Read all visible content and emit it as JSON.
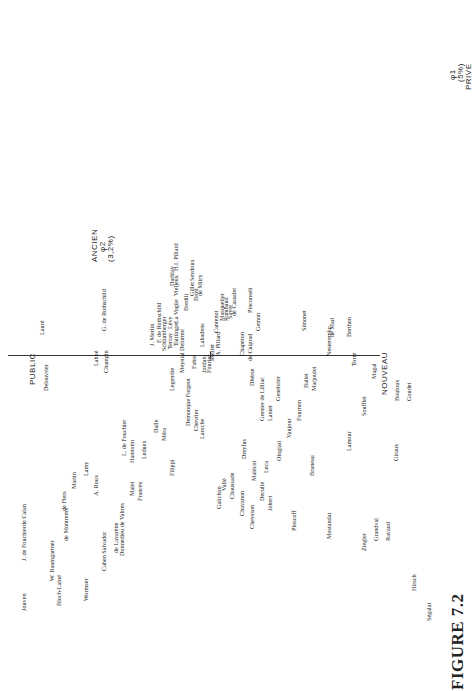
{
  "figure": {
    "caption": "FIGURE 7.2"
  },
  "axes": {
    "top": {
      "label": "ANCIEN",
      "phi": "φ2",
      "pct": "(3,2%)"
    },
    "right": {
      "label": "NOUVEAU"
    },
    "left": {
      "label": "PUBLIC"
    },
    "far_right": {
      "phi": "φ1",
      "pct": "(5%)",
      "label": "PRIVE"
    }
  },
  "names": [
    {
      "t": "Jouven",
      "x": 20,
      "y": 80
    },
    {
      "t": "J. de Fouchier",
      "x": 20,
      "y": 130
    },
    {
      "t": "de Calan",
      "x": 20,
      "y": 165
    },
    {
      "t": "W. Baumgartner",
      "x": 48,
      "y": 110
    },
    {
      "t": "de Flers",
      "x": 60,
      "y": 180
    },
    {
      "t": "Martin",
      "x": 70,
      "y": 202
    },
    {
      "t": "Lamy",
      "x": 82,
      "y": 215
    },
    {
      "t": "A. Roux",
      "x": 92,
      "y": 195
    },
    {
      "t": "de Lavarène",
      "x": 112,
      "y": 138
    },
    {
      "t": "Donnedieu de Vabres",
      "x": 118,
      "y": 135
    },
    {
      "t": "Malet",
      "x": 128,
      "y": 195
    },
    {
      "t": "Francès",
      "x": 136,
      "y": 190
    },
    {
      "t": "L. de Fouchier",
      "x": 120,
      "y": 235
    },
    {
      "t": "Hannotin",
      "x": 128,
      "y": 228
    },
    {
      "t": "Dalle",
      "x": 152,
      "y": 258
    },
    {
      "t": "Méra",
      "x": 160,
      "y": 250
    },
    {
      "t": "Legendre",
      "x": 168,
      "y": 300
    },
    {
      "t": "Meynial",
      "x": 178,
      "y": 318
    },
    {
      "t": "Labadens",
      "x": 198,
      "y": 344
    },
    {
      "t": "Cantenot",
      "x": 212,
      "y": 358
    },
    {
      "t": "Fourier",
      "x": 205,
      "y": 318
    },
    {
      "t": "Demonque Forgeot",
      "x": 184,
      "y": 265
    },
    {
      "t": "Chevrier",
      "x": 192,
      "y": 260
    },
    {
      "t": "Laroche",
      "x": 198,
      "y": 252
    },
    {
      "t": "Filippi",
      "x": 168,
      "y": 215
    },
    {
      "t": "Leduex",
      "x": 140,
      "y": 232
    },
    {
      "t": "Cahen Salvador",
      "x": 100,
      "y": 120
    },
    {
      "t": "Wormser",
      "x": 82,
      "y": 90
    },
    {
      "t": "Bloch-Lainé",
      "x": 55,
      "y": 85
    },
    {
      "t": "de Montremy",
      "x": 62,
      "y": 150
    },
    {
      "t": "Lauré",
      "x": 38,
      "y": 356
    },
    {
      "t": "Delouvrier",
      "x": 42,
      "y": 300
    },
    {
      "t": "Dreyfus",
      "x": 240,
      "y": 232
    },
    {
      "t": "Malécot",
      "x": 250,
      "y": 210
    },
    {
      "t": "Leca",
      "x": 262,
      "y": 218
    },
    {
      "t": "Grenier de Lilliac",
      "x": 258,
      "y": 270
    },
    {
      "t": "Lanier",
      "x": 266,
      "y": 270
    },
    {
      "t": "Genebrier",
      "x": 274,
      "y": 290
    },
    {
      "t": "Dhérse",
      "x": 248,
      "y": 305
    },
    {
      "t": "Vaujour",
      "x": 285,
      "y": 253
    },
    {
      "t": "Fournon",
      "x": 295,
      "y": 270
    },
    {
      "t": "Ballet",
      "x": 302,
      "y": 303
    },
    {
      "t": "Marjoulet",
      "x": 310,
      "y": 300
    },
    {
      "t": "Simonet",
      "x": 300,
      "y": 360
    },
    {
      "t": "de Mari",
      "x": 328,
      "y": 354
    },
    {
      "t": "Berthon",
      "x": 345,
      "y": 354
    },
    {
      "t": "Galichon",
      "x": 215,
      "y": 182
    },
    {
      "t": "Vallé",
      "x": 220,
      "y": 200
    },
    {
      "t": "Chaussade",
      "x": 228,
      "y": 192
    },
    {
      "t": "Chavanon",
      "x": 238,
      "y": 175
    },
    {
      "t": "Cheysson",
      "x": 248,
      "y": 162
    },
    {
      "t": "Deculle",
      "x": 258,
      "y": 190
    },
    {
      "t": "Jobert",
      "x": 266,
      "y": 180
    },
    {
      "t": "Ologiati",
      "x": 275,
      "y": 230
    },
    {
      "t": "Ploscoff",
      "x": 290,
      "y": 160
    },
    {
      "t": "Bruneau",
      "x": 308,
      "y": 215
    },
    {
      "t": "Mostandat",
      "x": 325,
      "y": 152
    },
    {
      "t": "Lamour",
      "x": 345,
      "y": 240
    },
    {
      "t": "Soufflet",
      "x": 360,
      "y": 275
    },
    {
      "t": "Ziegler",
      "x": 360,
      "y": 140
    },
    {
      "t": "Grandval",
      "x": 372,
      "y": 150
    },
    {
      "t": "Ravaud",
      "x": 384,
      "y": 150
    },
    {
      "t": "Giraux",
      "x": 392,
      "y": 230
    },
    {
      "t": "Hirsch",
      "x": 410,
      "y": 100
    },
    {
      "t": "Ségalat",
      "x": 425,
      "y": 70
    },
    {
      "t": "Bouloux",
      "x": 393,
      "y": 290
    },
    {
      "t": "Goudet",
      "x": 405,
      "y": 290
    },
    {
      "t": "Magal",
      "x": 370,
      "y": 312
    },
    {
      "t": "Torre",
      "x": 350,
      "y": 325
    },
    {
      "t": "Nesteremko",
      "x": 325,
      "y": 335
    },
    {
      "t": "Champin",
      "x": 102,
      "y": 318
    },
    {
      "t": "G. de Rothschild",
      "x": 100,
      "y": 360
    },
    {
      "t": "Labbé",
      "x": 92,
      "y": 325
    },
    {
      "t": "J. Merlin",
      "x": 148,
      "y": 345
    },
    {
      "t": "F. de Rothschild",
      "x": 155,
      "y": 348
    },
    {
      "t": "Schlumberger",
      "x": 160,
      "y": 340
    },
    {
      "t": "Terray",
      "x": 166,
      "y": 342
    },
    {
      "t": "Lévy",
      "x": 166,
      "y": 362
    },
    {
      "t": "Taittinger",
      "x": 172,
      "y": 345
    },
    {
      "t": "La Vogüe",
      "x": 172,
      "y": 368
    },
    {
      "t": "Delorme",
      "x": 178,
      "y": 340
    },
    {
      "t": "Fabre",
      "x": 190,
      "y": 322
    },
    {
      "t": "Jordan",
      "x": 200,
      "y": 318
    },
    {
      "t": "Rollier",
      "x": 208,
      "y": 330
    },
    {
      "t": "Vieljeux",
      "x": 172,
      "y": 395
    },
    {
      "t": "Darblay",
      "x": 168,
      "y": 405
    },
    {
      "t": "H.I. Pillard",
      "x": 172,
      "y": 420
    },
    {
      "t": "Seydoux",
      "x": 188,
      "y": 410
    },
    {
      "t": "Gillet",
      "x": 188,
      "y": 395
    },
    {
      "t": "Bredili",
      "x": 182,
      "y": 380
    },
    {
      "t": "Brott",
      "x": 192,
      "y": 390
    },
    {
      "t": "de Mitry",
      "x": 196,
      "y": 395
    },
    {
      "t": "A. Pillard",
      "x": 214,
      "y": 335
    },
    {
      "t": "Masquelier",
      "x": 218,
      "y": 370
    },
    {
      "t": "Rambaud",
      "x": 222,
      "y": 370
    },
    {
      "t": "Sayre",
      "x": 226,
      "y": 372
    },
    {
      "t": "de Cassalet",
      "x": 230,
      "y": 375
    },
    {
      "t": "Chaperon",
      "x": 238,
      "y": 335
    },
    {
      "t": "de Cuiprad",
      "x": 246,
      "y": 330
    },
    {
      "t": "Pinconseli",
      "x": 246,
      "y": 378
    },
    {
      "t": "Gemon",
      "x": 254,
      "y": 360
    }
  ]
}
